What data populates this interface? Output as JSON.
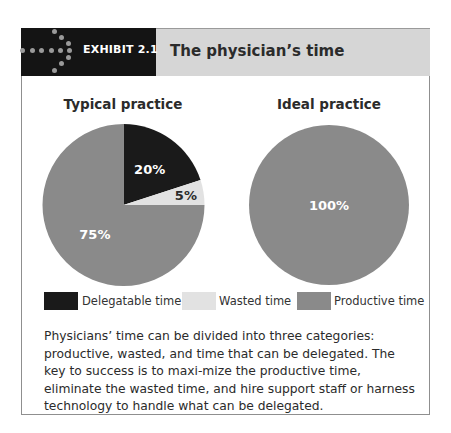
{
  "header": {
    "exhibit_label": "EXHIBIT 2.1",
    "title": "The physician’s time"
  },
  "colors": {
    "delegatable": "#1a1a1a",
    "wasted": "#e2e2e2",
    "productive": "#8a8a8a"
  },
  "chart_data": [
    {
      "type": "pie",
      "title": "Typical practice",
      "categories": [
        "Delegatable time",
        "Wasted time",
        "Productive time"
      ],
      "values": [
        20,
        5,
        75
      ],
      "labels": [
        "20%",
        "5%",
        "75%"
      ],
      "start": "12 o'clock, clockwise"
    },
    {
      "type": "pie",
      "title": "Ideal practice",
      "categories": [
        "Delegatable time",
        "Wasted time",
        "Productive time"
      ],
      "values": [
        0,
        0,
        100
      ],
      "labels": [
        "",
        "",
        "100%"
      ],
      "start": "12 o'clock, clockwise"
    }
  ],
  "legend": {
    "placement": "bottom",
    "items": [
      {
        "label": "Delegatable time",
        "key": "delegatable"
      },
      {
        "label": "Wasted time",
        "key": "wasted"
      },
      {
        "label": "Productive time",
        "key": "productive"
      }
    ]
  },
  "caption": "Physicians’ time can be divided into three categories: productive, wasted, and time that can be delegated. The key to success is to maxi-mize the productive time, eliminate the wasted time, and hire support staff or harness technology to handle what can be delegated."
}
